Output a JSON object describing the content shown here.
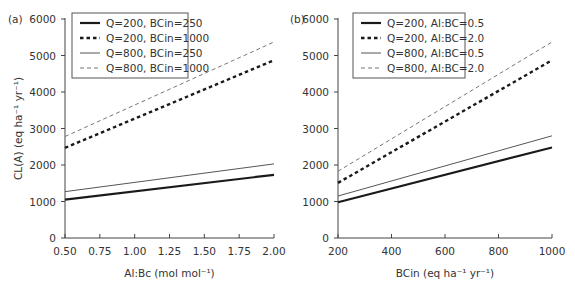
{
  "chart_data": [
    {
      "type": "line",
      "panel_label": "(a)",
      "title": "",
      "xlabel": "Al:Bc (mol mol⁻¹)",
      "ylabel": "CL(A) (eq ha⁻¹ yr⁻¹)",
      "xlim": [
        0.5,
        2.0
      ],
      "ylim": [
        0,
        6000
      ],
      "x_ticks": [
        "0.50",
        "0.75",
        "1.00",
        "1.25",
        "1.50",
        "1.75",
        "2.00"
      ],
      "y_ticks": [
        "0",
        "1000",
        "2000",
        "3000",
        "4000",
        "5000",
        "6000"
      ],
      "grid": false,
      "legend_position": "upper left",
      "x": [
        0.5,
        2.0
      ],
      "series": [
        {
          "name": "Q=200, BCin=250",
          "style": "solid-thick",
          "color": "#1a1a1a",
          "values": [
            1050,
            1730
          ]
        },
        {
          "name": "Q=200, BCin=1000",
          "style": "dashed-thick",
          "color": "#1a1a1a",
          "values": [
            2470,
            4870
          ]
        },
        {
          "name": "Q=800, BCin=250",
          "style": "solid-thin",
          "color": "#555555",
          "values": [
            1270,
            2030
          ]
        },
        {
          "name": "Q=800, BCin=1000",
          "style": "dashed-thin",
          "color": "#777777",
          "values": [
            2780,
            5370
          ]
        }
      ]
    },
    {
      "type": "line",
      "panel_label": "(b)",
      "title": "",
      "xlabel": "BCin (eq ha⁻¹ yr⁻¹)",
      "ylabel": "",
      "xlim": [
        200,
        1000
      ],
      "ylim": [
        0,
        6000
      ],
      "x_ticks": [
        "200",
        "400",
        "600",
        "800",
        "1000"
      ],
      "y_ticks": [
        "0",
        "1000",
        "2000",
        "3000",
        "4000",
        "5000",
        "6000"
      ],
      "grid": false,
      "legend_position": "upper left",
      "x": [
        200,
        1000
      ],
      "series": [
        {
          "name": "Q=200, Al:BC=0.5",
          "style": "solid-thick",
          "color": "#1a1a1a",
          "values": [
            980,
            2480
          ]
        },
        {
          "name": "Q=200, Al:BC=2.0",
          "style": "dashed-thick",
          "color": "#1a1a1a",
          "values": [
            1510,
            4870
          ]
        },
        {
          "name": "Q=800, Al:BC=0.5",
          "style": "solid-thin",
          "color": "#555555",
          "values": [
            1150,
            2800
          ]
        },
        {
          "name": "Q=800, Al:BC=2.0",
          "style": "dashed-thin",
          "color": "#777777",
          "values": [
            1830,
            5370
          ]
        }
      ]
    }
  ]
}
